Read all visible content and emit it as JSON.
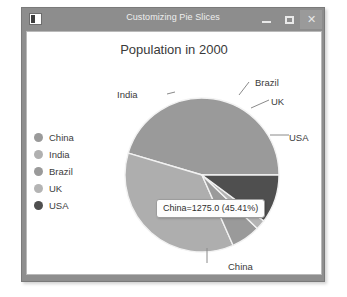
{
  "window": {
    "title": "Customizing Pie Slices",
    "icon": "app-icon",
    "controls": {
      "minimize": "–",
      "maximize": "□",
      "close": "✕"
    }
  },
  "chart_data": {
    "type": "pie",
    "title": "Population in 2000",
    "categories": [
      "China",
      "India",
      "Brazil",
      "UK",
      "USA"
    ],
    "values": [
      1275.0,
      1017.0,
      172.0,
      59.0,
      285.0
    ],
    "percentages": [
      45.41,
      36.21,
      6.12,
      2.1,
      10.15
    ],
    "colors": [
      "#9a9a9a",
      "#aeaeae",
      "#9a9a9a",
      "#b4b4b4",
      "#4f4f4f"
    ],
    "legend_position": "left",
    "grid": false,
    "start_angle": 0,
    "direction": "counterclockwise",
    "slice_labels": [
      "China",
      "India",
      "Brazil",
      "UK",
      "USA"
    ],
    "annotations": [
      {
        "text": "China=1275.0 (45.41%)",
        "series": "China",
        "value": 1275.0,
        "percent": "45.41%"
      }
    ],
    "xlabel": "",
    "ylabel": ""
  },
  "legend": {
    "items": [
      {
        "label": "China",
        "color": "#9a9a9a"
      },
      {
        "label": "India",
        "color": "#b0b0b0"
      },
      {
        "label": "Brazil",
        "color": "#9a9a9a"
      },
      {
        "label": "UK",
        "color": "#b4b4b4"
      },
      {
        "label": "USA",
        "color": "#4f4f4f"
      }
    ]
  },
  "pie_labels": {
    "india": "India",
    "brazil": "Brazil",
    "uk": "UK",
    "usa": "USA",
    "china": "China"
  },
  "tooltip": {
    "text": "China=1275.0 (45.41%)"
  }
}
